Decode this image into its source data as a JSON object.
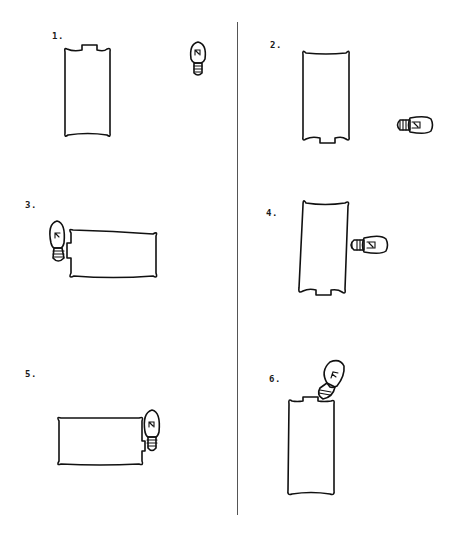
{
  "diagram": {
    "type": "battery-bulb-circuit-configurations",
    "layout": "two columns, three rows, separated by a vertical divider",
    "colors": {
      "ink": "#111111",
      "background": "#ffffff",
      "divider": "#555555"
    },
    "panels": [
      {
        "label": "1.",
        "battery": "vertical, positive nub at top",
        "bulb": "upright, separate from battery (not touching)"
      },
      {
        "label": "2.",
        "battery": "vertical, positive nub at bottom",
        "bulb": "horizontal, separate from battery (not touching)"
      },
      {
        "label": "3.",
        "battery": "horizontal, nub at left end",
        "bulb": "upright, base touching left end nub"
      },
      {
        "label": "4.",
        "battery": "vertical, nub at bottom",
        "bulb": "horizontal, base touching right side of battery"
      },
      {
        "label": "5.",
        "battery": "horizontal, nub at right end",
        "bulb": "upright, side touching right end, base at nub"
      },
      {
        "label": "6.",
        "battery": "vertical, nub at top",
        "bulb": "tilted, base touching top edge next to nub"
      }
    ]
  }
}
